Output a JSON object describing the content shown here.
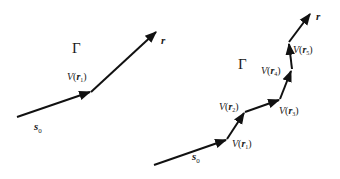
{
  "colors": {
    "stroke": "#111111",
    "text": "#1a1a1a",
    "background": "#ffffff"
  },
  "left_diagram": {
    "region_label": "Γ",
    "start_label": {
      "base": "s",
      "sub": "0"
    },
    "end_label": "r",
    "vertices": [
      {
        "func": "V",
        "arg": "r",
        "sub": "1"
      }
    ]
  },
  "right_diagram": {
    "region_label": "Γ",
    "start_label": {
      "base": "s",
      "sub": "0"
    },
    "end_label": "r",
    "vertices": [
      {
        "func": "V",
        "arg": "r",
        "sub": "1"
      },
      {
        "func": "V",
        "arg": "r",
        "sub": "2"
      },
      {
        "func": "V",
        "arg": "r",
        "sub": "3"
      },
      {
        "func": "V",
        "arg": "r",
        "sub": "4"
      },
      {
        "func": "V",
        "arg": "r",
        "sub": "5"
      }
    ]
  }
}
